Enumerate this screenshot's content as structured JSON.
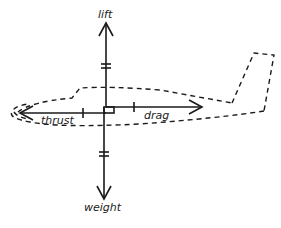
{
  "diagram": {
    "colors": {
      "ink": "#1a1a1a",
      "background": "#ffffff"
    },
    "forces": {
      "lift": {
        "label": "lift",
        "direction": "up"
      },
      "weight": {
        "label": "weight",
        "direction": "down"
      },
      "thrust": {
        "label": "thrust",
        "direction": "left"
      },
      "drag": {
        "label": "drag",
        "direction": "right"
      }
    },
    "outline": {
      "style": "dashed",
      "shape": "airplane-fuselage-with-tail"
    },
    "markers": {
      "equal_vertical": "double-tick on lift and weight arrows",
      "equal_horizontal": "single tick on thrust and drag arrows",
      "right_angle": "square at origin"
    }
  }
}
